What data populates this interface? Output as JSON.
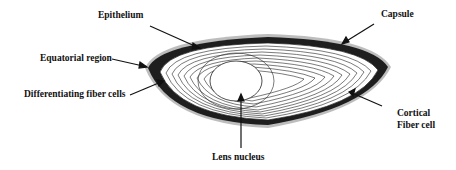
{
  "figure": {
    "labels": {
      "epithelium": "Epithelium",
      "capsule": "Capsule",
      "equatorial_region": "Equatorial region",
      "differentiating_fiber_cells": "Differentiating fiber cells",
      "cortical_line1": "Cortical",
      "cortical_line2": "Fiber cell",
      "lens_nucleus": "Lens nucleus"
    },
    "colors": {
      "line": "#111111",
      "rim": "#1a1a1a",
      "halo": "#9a9a9a",
      "background": "#ffffff"
    }
  }
}
